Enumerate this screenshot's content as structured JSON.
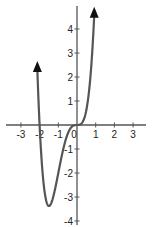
{
  "chart_data": {
    "type": "line",
    "title": "",
    "xlabel": "",
    "ylabel": "",
    "function": "y = 2x^3(x+2)",
    "xlim": [
      -3.8,
      3.8
    ],
    "ylim": [
      -4.2,
      5
    ],
    "x_ticks": [
      -3,
      -2,
      -1,
      0,
      1,
      2,
      3
    ],
    "y_ticks": [
      -4,
      -3,
      -2,
      -1,
      1,
      2,
      3,
      4
    ],
    "x_tick_labels": [
      "-3",
      "-2",
      "-1",
      "0",
      "1",
      "2",
      "3"
    ],
    "y_tick_labels": [
      "-4",
      "-3",
      "-2",
      "-1",
      "1",
      "2",
      "3",
      "4"
    ],
    "key_points": [
      {
        "x": -2,
        "y": 0,
        "label": "x-intercept"
      },
      {
        "x": 0,
        "y": 0,
        "label": "x-intercept (flat)"
      },
      {
        "x": -1.5,
        "y": -3.375,
        "label": "minimum"
      }
    ],
    "series": [
      {
        "name": "curve",
        "x": [
          -2.1,
          -2.0,
          -1.9,
          -1.8,
          -1.7,
          -1.6,
          -1.5,
          -1.4,
          -1.3,
          -1.2,
          -1.0,
          -0.8,
          -0.6,
          -0.4,
          -0.2,
          0,
          0.2,
          0.4,
          0.6,
          0.8,
          0.88
        ],
        "y": [
          1.85,
          0,
          -1.37,
          -2.33,
          -2.95,
          -3.28,
          -3.375,
          -3.29,
          -3.08,
          -2.76,
          -2.0,
          -1.23,
          -0.6,
          -0.2,
          -0.03,
          0,
          0.04,
          0.31,
          1.12,
          2.87,
          3.9
        ]
      }
    ],
    "arrows": "both ends of curve point upward",
    "grid": false,
    "legend": null
  },
  "axes": {
    "color": "#555555",
    "curve_color": "#555555"
  }
}
